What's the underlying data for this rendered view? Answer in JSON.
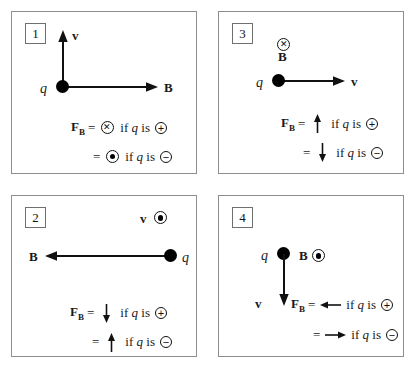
{
  "figure": {
    "colors": {
      "panel_border": "#8d8d8d",
      "ink": "#111111",
      "background": "#ffffff"
    },
    "symbols": {
      "into_page": "into-page-cross",
      "out_of_page": "out-of-page-dot",
      "positive": "+",
      "negative": "−",
      "force_label": "F",
      "force_subscript": "B",
      "equals": "=",
      "charge_label": "q",
      "velocity_label": "v",
      "field_label": "B",
      "condition_prefix": "if",
      "condition_middle": "is"
    }
  },
  "panels": [
    {
      "number": "1",
      "position": "top-left",
      "velocity": {
        "label": "v",
        "direction": "up",
        "representation": "arrow"
      },
      "field": {
        "label": "B",
        "direction": "right",
        "representation": "arrow"
      },
      "charge": {
        "label": "q",
        "position": "origin"
      },
      "force_lines": [
        {
          "force": "F",
          "sub": "B",
          "equals": "=",
          "mark": "into-page-cross",
          "mark_type": "circle-x",
          "cond_if": "if",
          "cond_q": "q",
          "cond_is": "is",
          "sign": "+"
        },
        {
          "force": "",
          "sub": "",
          "equals": "=",
          "mark": "out-of-page-dot",
          "mark_type": "circle-dot",
          "cond_if": "if",
          "cond_q": "q",
          "cond_is": "is",
          "sign": "−"
        }
      ]
    },
    {
      "number": "3",
      "position": "top-right",
      "velocity": {
        "label": "v",
        "direction": "right",
        "representation": "arrow"
      },
      "field": {
        "label": "B",
        "direction": "into-page",
        "representation": "circle-x"
      },
      "charge": {
        "label": "q",
        "position": "left-of-arrow"
      },
      "force_lines": [
        {
          "force": "F",
          "sub": "B",
          "equals": "=",
          "mark": "arrow-up",
          "mark_type": "arrow-up",
          "cond_if": "if",
          "cond_q": "q",
          "cond_is": "is",
          "sign": "+"
        },
        {
          "force": "",
          "sub": "",
          "equals": "=",
          "mark": "arrow-down",
          "mark_type": "arrow-down",
          "cond_if": "if",
          "cond_q": "q",
          "cond_is": "is",
          "sign": "−"
        }
      ]
    },
    {
      "number": "2",
      "position": "bottom-left",
      "velocity": {
        "label": "v",
        "direction": "out-of-page",
        "representation": "circle-dot"
      },
      "field": {
        "label": "B",
        "direction": "left",
        "representation": "arrow"
      },
      "charge": {
        "label": "q",
        "position": "right-end"
      },
      "force_lines": [
        {
          "force": "F",
          "sub": "B",
          "equals": "=",
          "mark": "arrow-down",
          "mark_type": "arrow-down",
          "cond_if": "if",
          "cond_q": "q",
          "cond_is": "is",
          "sign": "+"
        },
        {
          "force": "",
          "sub": "",
          "equals": "=",
          "mark": "arrow-up",
          "mark_type": "arrow-up",
          "cond_if": "if",
          "cond_q": "q",
          "cond_is": "is",
          "sign": "−"
        }
      ]
    },
    {
      "number": "4",
      "position": "bottom-right",
      "velocity": {
        "label": "v",
        "direction": "down",
        "representation": "arrow"
      },
      "field": {
        "label": "B",
        "direction": "out-of-page",
        "representation": "circle-dot"
      },
      "charge": {
        "label": "q",
        "position": "top-of-arrow"
      },
      "force_lines": [
        {
          "force": "F",
          "sub": "B",
          "equals": "=",
          "mark": "arrow-left",
          "mark_type": "arrow-left",
          "cond_if": "if",
          "cond_q": "q",
          "cond_is": "is",
          "sign": "+"
        },
        {
          "force": "",
          "sub": "",
          "equals": "=",
          "mark": "arrow-right",
          "mark_type": "arrow-right",
          "cond_if": "if",
          "cond_q": "q",
          "cond_is": "is",
          "sign": "−"
        }
      ]
    }
  ]
}
